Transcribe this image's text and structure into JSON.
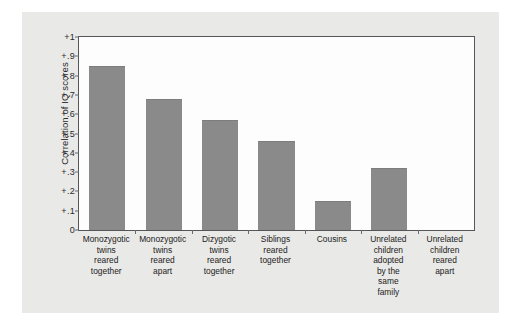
{
  "figure": {
    "ylabel": "Correlation of IQ scores"
  },
  "chart_data": {
    "type": "bar",
    "title": "",
    "subtitle": "",
    "xlabel": "",
    "ylabel": "Correlation of IQ scores",
    "ylim": [
      0,
      1
    ],
    "grid": false,
    "legend": null,
    "bar_color": "#8a8a8a",
    "plot_background": "#fdfdfd",
    "panel_background": "#e9e9e7",
    "axis_color": "#55565a",
    "ytick_labels": [
      "+1",
      "+.9",
      "+.8",
      "+.7",
      "+.6",
      "+.5",
      "+.4",
      "+.3",
      "+.2",
      "+.1",
      "0"
    ],
    "ytick_values": [
      1.0,
      0.9,
      0.8,
      0.7,
      0.6,
      0.5,
      0.4,
      0.3,
      0.2,
      0.1,
      0.0
    ],
    "categories": [
      "Monozygotic twins reared together",
      "Monozygotic twins reared apart",
      "Dizygotic twins reared together",
      "Siblings reared together",
      "Cousins",
      "Unrelated children adopted by the same family",
      "Unrelated children reared apart"
    ],
    "category_lines": [
      [
        "Monozygotic",
        "twins",
        "reared",
        "together"
      ],
      [
        "Monozygotic",
        "twins",
        "reared",
        "apart"
      ],
      [
        "Dizygotic",
        "twins",
        "reared",
        "together"
      ],
      [
        "Siblings",
        "reared",
        "together"
      ],
      [
        "Cousins"
      ],
      [
        "Unrelated",
        "children",
        "adopted",
        "by the",
        "same",
        "family"
      ],
      [
        "Unrelated",
        "children",
        "reared",
        "apart"
      ]
    ],
    "values": [
      0.85,
      0.68,
      0.57,
      0.46,
      0.15,
      0.32,
      0.0
    ]
  }
}
